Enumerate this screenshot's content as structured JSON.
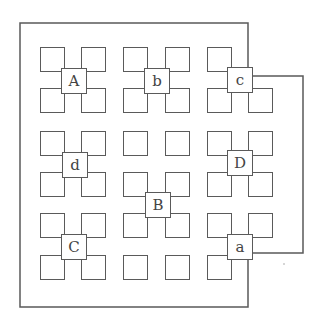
{
  "diagram": {
    "type": "grid-of-squares-with-labeled-junctions",
    "colors": {
      "line": "#5a5a5a",
      "text": "#444444",
      "background": "#ffffff"
    },
    "grid": {
      "columns_x": [
        40,
        81,
        123,
        165,
        207,
        248
      ],
      "rows_y": [
        47,
        88,
        131,
        172,
        213,
        255
      ],
      "square_size": 25,
      "missing_squares": [
        [
          5,
          0
        ],
        [
          5,
          5
        ]
      ]
    },
    "labels": [
      {
        "text": "A",
        "x": 61,
        "y": 68
      },
      {
        "text": "b",
        "x": 144,
        "y": 68
      },
      {
        "text": "c",
        "x": 227,
        "y": 67
      },
      {
        "text": "d",
        "x": 62,
        "y": 152
      },
      {
        "text": "D",
        "x": 227,
        "y": 150
      },
      {
        "text": "B",
        "x": 145,
        "y": 192
      },
      {
        "text": "C",
        "x": 61,
        "y": 234
      },
      {
        "text": "a",
        "x": 227,
        "y": 234
      }
    ],
    "outline_path": "M248,67 L248,23 L20,23 L20,307 L248,307 L248,260 M252,76 L303,76 L303,253 L253,253"
  }
}
